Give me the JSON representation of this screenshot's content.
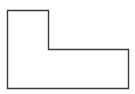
{
  "diagram": {
    "shape": "L-shaped polygon",
    "points": "7.5,10.5 48.5,10.5 48.5,49.5 128.5,49.5 128.5,88.5 7.5,88.5",
    "stroke": "#3a3a3a",
    "fill": "#ffffff",
    "stroke_width": "1.4"
  }
}
